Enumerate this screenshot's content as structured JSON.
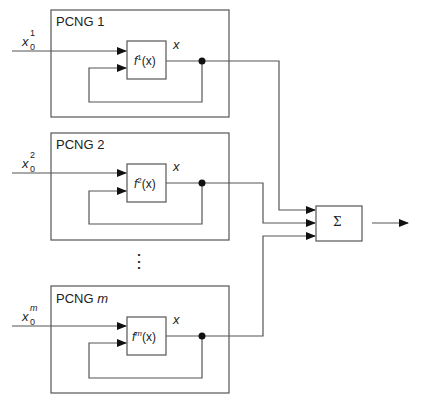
{
  "diagram": {
    "generators": [
      {
        "label_prefix": "PCNG",
        "index": "1",
        "input_base": "x",
        "input_sub": "0",
        "input_sup": "1",
        "func_base": "f",
        "func_sup": "1",
        "func_arg": "(x)",
        "output_label": "x"
      },
      {
        "label_prefix": "PCNG",
        "index": "2",
        "input_base": "x",
        "input_sub": "0",
        "input_sup": "2",
        "func_base": "f",
        "func_sup": "2",
        "func_arg": "(x)",
        "output_label": "x"
      },
      {
        "label_prefix": "PCNG",
        "index": "m",
        "input_base": "x",
        "input_sub": "0",
        "input_sup": "m",
        "func_base": "f",
        "func_sup": "m",
        "func_arg": "(x)",
        "output_label": "x"
      }
    ],
    "ellipsis": "⋮",
    "summer": {
      "symbol": "Σ"
    },
    "colors": {
      "line": "#444444",
      "box": "#555555",
      "dot": "#111111"
    }
  }
}
